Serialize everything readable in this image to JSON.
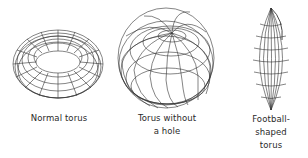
{
  "figures": [
    {
      "id": "normal-torus",
      "label_lines": [
        "Normal torus"
      ]
    },
    {
      "id": "horn-torus",
      "label_lines": [
        "Torus without",
        "a hole"
      ]
    },
    {
      "id": "spindle-torus",
      "label_lines": [
        "Football-",
        "shaped",
        "torus"
      ]
    }
  ],
  "colors": {
    "line": "#333333",
    "background": "#ffffff",
    "text": "#2a2a2a"
  }
}
